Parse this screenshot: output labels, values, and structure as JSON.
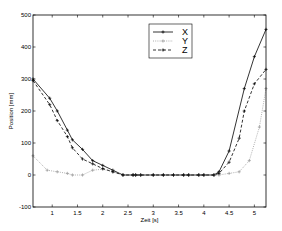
{
  "chart_data": {
    "type": "line",
    "title": "",
    "xlabel": "Zeit [s]",
    "ylabel": "Position [mm]",
    "xlim": [
      0.62,
      5.23
    ],
    "ylim": [
      -100,
      500
    ],
    "xticks": [
      1,
      1.5,
      2,
      2.5,
      3,
      3.5,
      4,
      4.5,
      5
    ],
    "xtick_labels": [
      "1",
      "1.5",
      "2",
      "2.5",
      "3",
      "3.5",
      "4",
      "4.5",
      "5"
    ],
    "yticks": [
      -100,
      0,
      100,
      200,
      300,
      400,
      500
    ],
    "ytick_labels": [
      "-100",
      "0",
      "100",
      "200",
      "300",
      "400",
      "500"
    ],
    "grid": false,
    "legend_position": "upper center",
    "series": [
      {
        "name": "X",
        "style": "solid",
        "color": "#000000",
        "marker": "+",
        "x": [
          0.62,
          0.95,
          1.1,
          1.3,
          1.4,
          1.6,
          1.8,
          2.0,
          2.2,
          2.4,
          2.6,
          2.65,
          2.75,
          3.0,
          3.2,
          3.4,
          3.6,
          3.7,
          3.9,
          4.0,
          4.2,
          4.3,
          4.5,
          4.8,
          5.0,
          5.23
        ],
        "y": [
          300,
          240,
          200,
          140,
          110,
          80,
          45,
          30,
          15,
          0,
          0,
          0,
          0,
          0,
          0,
          0,
          0,
          0,
          0,
          0,
          0,
          10,
          75,
          270,
          370,
          455
        ]
      },
      {
        "name": "Y",
        "style": "dotted",
        "color": "#9a9a9a",
        "marker": "+",
        "x": [
          0.62,
          0.9,
          1.1,
          1.3,
          1.4,
          1.6,
          1.8,
          2.0,
          2.2,
          2.4,
          2.6,
          2.65,
          2.75,
          3.0,
          3.2,
          3.4,
          3.6,
          3.7,
          3.9,
          4.0,
          4.2,
          4.3,
          4.5,
          4.7,
          4.9,
          5.1,
          5.23
        ],
        "y": [
          60,
          15,
          10,
          5,
          0,
          0,
          15,
          18,
          10,
          0,
          0,
          0,
          0,
          0,
          0,
          0,
          0,
          0,
          0,
          0,
          0,
          0,
          5,
          10,
          45,
          150,
          270
        ]
      },
      {
        "name": "Z",
        "style": "dashed",
        "color": "#000000",
        "marker": "+",
        "x": [
          0.62,
          0.95,
          1.1,
          1.3,
          1.4,
          1.6,
          1.8,
          2.0,
          2.2,
          2.4,
          2.6,
          2.65,
          2.75,
          3.0,
          3.2,
          3.4,
          3.6,
          3.7,
          3.9,
          4.0,
          4.2,
          4.3,
          4.5,
          4.7,
          4.8,
          5.0,
          5.23
        ],
        "y": [
          295,
          220,
          170,
          120,
          85,
          50,
          35,
          20,
          10,
          0,
          0,
          0,
          0,
          0,
          0,
          0,
          0,
          0,
          0,
          0,
          0,
          5,
          40,
          115,
          200,
          285,
          330
        ]
      }
    ]
  },
  "layout": {
    "plot_left": 33,
    "plot_right": 266,
    "plot_top": 15,
    "plot_bottom": 207,
    "legend_box": [
      149,
      24,
      43,
      34
    ]
  }
}
